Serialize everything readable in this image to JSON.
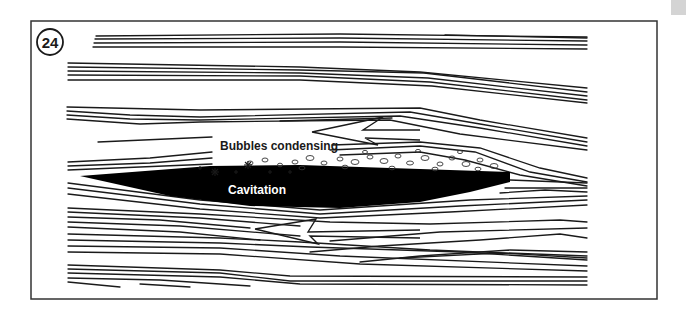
{
  "figure": {
    "number": "24",
    "labels": {
      "bubbles": "Bubbles condensing",
      "cavity": "Cavitation"
    },
    "colors": {
      "ink": "#1a1a1a",
      "frame": "#333333",
      "cavity_fill": "#000000",
      "background": "#ffffff",
      "corner_tab": "#d4d4d4"
    },
    "elements": {
      "frame": "rectangular border",
      "foil": "black hydrofoil-shaped cavitation region",
      "streamlines": "bundles of flow lines passing around the foil",
      "reverse_flow_arrows": 2,
      "bubble_zone": "dotted region of small ovals and star-shaped bursts above foil"
    }
  }
}
